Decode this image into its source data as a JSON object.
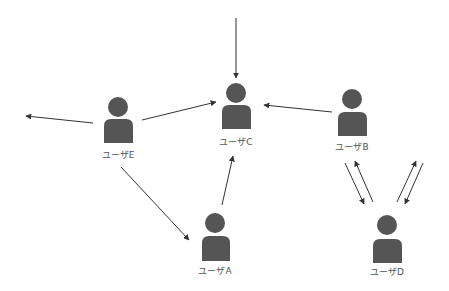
{
  "diagram": {
    "colors": {
      "person": "#555555",
      "edge": "#333333",
      "label": "#555555",
      "background": "#ffffff"
    },
    "nodes": [
      {
        "id": "A",
        "label": "ユーザA",
        "cx": 215,
        "headY": 223,
        "headR": 10,
        "bodyX": 202,
        "bodyY": 236,
        "bodyW": 28,
        "bodyH": 25,
        "labelY": 274
      },
      {
        "id": "B",
        "label": "ユーザB",
        "cx": 352,
        "headY": 99,
        "headR": 10,
        "bodyX": 338,
        "bodyY": 112,
        "bodyW": 29,
        "bodyH": 24,
        "labelY": 150
      },
      {
        "id": "C",
        "label": "ユーザC",
        "cx": 236,
        "headY": 93,
        "headR": 10,
        "bodyX": 222,
        "bodyY": 105,
        "bodyW": 29,
        "bodyH": 24,
        "labelY": 145
      },
      {
        "id": "D",
        "label": "ユーザD",
        "cx": 387,
        "headY": 225,
        "headR": 10,
        "bodyX": 373,
        "bodyY": 239,
        "bodyW": 29,
        "bodyH": 24,
        "labelY": 275
      },
      {
        "id": "E",
        "label": "ユーザE",
        "cx": 118,
        "headY": 107,
        "headR": 10,
        "bodyX": 104,
        "bodyY": 119,
        "bodyW": 29,
        "bodyH": 24,
        "labelY": 158
      }
    ],
    "edges": [
      {
        "from": "external-top",
        "to": "C",
        "x1": 236,
        "y1": 18,
        "x2": 236,
        "y2": 78
      },
      {
        "from": "E",
        "to": "external-left",
        "x1": 93,
        "y1": 123,
        "x2": 26,
        "y2": 116
      },
      {
        "from": "E",
        "to": "C",
        "x1": 142,
        "y1": 120,
        "x2": 216,
        "y2": 102
      },
      {
        "from": "B",
        "to": "C",
        "x1": 332,
        "y1": 112,
        "x2": 264,
        "y2": 105
      },
      {
        "from": "E",
        "to": "A",
        "x1": 121,
        "y1": 167,
        "x2": 189,
        "y2": 240
      },
      {
        "from": "A",
        "to": "C",
        "x1": 222,
        "y1": 205,
        "x2": 233,
        "y2": 156
      },
      {
        "from": "B",
        "to": "D",
        "x1": 345,
        "y1": 163,
        "x2": 364,
        "y2": 204
      },
      {
        "from": "D",
        "to": "B",
        "x1": 373,
        "y1": 202,
        "x2": 355,
        "y2": 161
      },
      {
        "from": "D",
        "to": "external-right",
        "x1": 397,
        "y1": 202,
        "x2": 416,
        "y2": 161
      },
      {
        "from": "external-right",
        "to": "D",
        "x1": 423,
        "y1": 163,
        "x2": 405,
        "y2": 204
      }
    ]
  }
}
